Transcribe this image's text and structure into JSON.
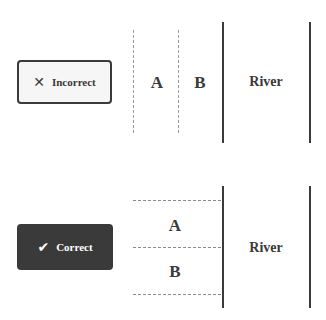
{
  "panels": {
    "incorrect": {
      "badge": {
        "icon": "close-icon",
        "icon_glyph": "✕",
        "label": "Incorrect"
      },
      "zones": [
        "A",
        "B"
      ],
      "river_label": "River",
      "layout": "zones side-by-side (parallel to river)"
    },
    "correct": {
      "badge": {
        "icon": "check-icon",
        "icon_glyph": "✔",
        "label": "Correct"
      },
      "zones": [
        "A",
        "B"
      ],
      "river_label": "River",
      "layout": "zones stacked (both adjacent to river)"
    }
  },
  "colors": {
    "line": "#3a3a3a",
    "dashed": "#9a9a9a",
    "correct_badge_bg": "#3a3a3a",
    "incorrect_badge_bg": "#f6f6f6"
  }
}
